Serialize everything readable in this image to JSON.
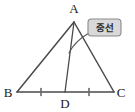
{
  "figure": {
    "colors": {
      "stroke": "#4a4a4a",
      "label_text": "#1a1a1a",
      "callout_fill": "#d9d9d9",
      "callout_border": "#8a8a8a",
      "callout_text": "#2b2b2b",
      "background": "#ffffff"
    },
    "vertices": [
      {
        "name": "A",
        "label": "A",
        "x": 74,
        "y": 22,
        "label_x": 74,
        "label_y": 13
      },
      {
        "name": "B",
        "label": "B",
        "x": 17,
        "y": 92,
        "label_x": 8,
        "label_y": 97
      },
      {
        "name": "C",
        "label": "C",
        "x": 114,
        "y": 92,
        "label_x": 121,
        "label_y": 97
      },
      {
        "name": "D",
        "label": "D",
        "x": 65,
        "y": 92,
        "label_x": 65,
        "label_y": 108
      }
    ],
    "segments": [
      {
        "name": "side-AB",
        "from": "A",
        "to": "B"
      },
      {
        "name": "side-AC",
        "from": "A",
        "to": "C"
      },
      {
        "name": "side-BC",
        "from": "B",
        "to": "C"
      },
      {
        "name": "median-AD",
        "from": "A",
        "to": "D"
      }
    ],
    "tick_marks": [
      {
        "name": "tick-BD",
        "x": 41,
        "y": 92
      },
      {
        "name": "tick-DC",
        "x": 89,
        "y": 92
      }
    ],
    "callout": {
      "label": "중선",
      "box_x": 88,
      "box_y": 19,
      "box_width": 33,
      "box_height": 17,
      "text_x": 104.5,
      "text_y": 31
    },
    "leader": {
      "name": "callout-leader-arc",
      "path": "M 89 33 C 82 37, 74 43, 69 53"
    }
  }
}
